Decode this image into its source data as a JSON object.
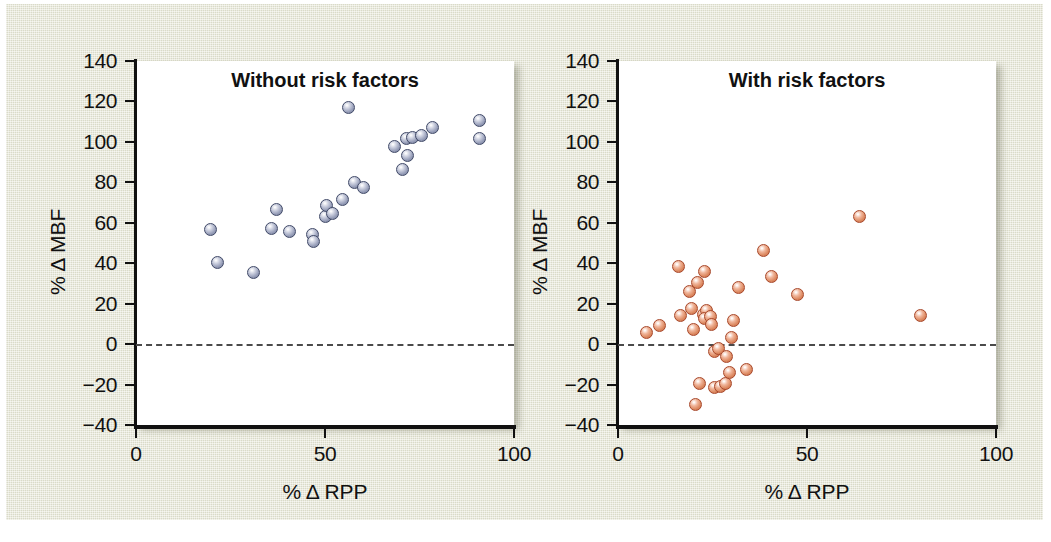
{
  "figure": {
    "background_color": "#e3e4d1",
    "panel_background": "#ffffff"
  },
  "axis": {
    "y_label": "% Δ MBF",
    "x_label": "% Δ RPP",
    "y_ticks": [
      140,
      120,
      100,
      80,
      60,
      40,
      20,
      0,
      -20,
      -40
    ],
    "y_tick_labels": [
      "140",
      "120",
      "100",
      "80",
      "60",
      "40",
      "20",
      "0",
      "−20",
      "−40"
    ],
    "x_ticks": [
      0,
      50,
      100
    ],
    "x_tick_labels": [
      "0",
      "50",
      "100"
    ],
    "ylim": [
      -40,
      140
    ],
    "xlim": [
      0,
      100
    ],
    "zero_reference_line": 0
  },
  "chart_data": [
    {
      "type": "scatter",
      "title": "Without risk factors",
      "xlabel": "% Δ RPP",
      "ylabel": "% Δ MBF",
      "xlim": [
        0,
        100
      ],
      "ylim": [
        -40,
        140
      ],
      "grid": false,
      "legend": "none",
      "marker_color": "#8f97b4",
      "marker_edge_color": "#414a68",
      "annotations": [
        "dashed horizontal reference line at % Δ MBF = 0"
      ],
      "points": [
        {
          "x": 19.8,
          "y": 56.5
        },
        {
          "x": 21.5,
          "y": 40.3
        },
        {
          "x": 31.0,
          "y": 35.5
        },
        {
          "x": 35.8,
          "y": 57.3
        },
        {
          "x": 37.2,
          "y": 66.5
        },
        {
          "x": 40.5,
          "y": 55.8
        },
        {
          "x": 46.8,
          "y": 54.0
        },
        {
          "x": 46.9,
          "y": 50.5
        },
        {
          "x": 50.2,
          "y": 63.0
        },
        {
          "x": 50.5,
          "y": 68.5
        },
        {
          "x": 54.5,
          "y": 71.5
        },
        {
          "x": 52.0,
          "y": 64.8
        },
        {
          "x": 56.3,
          "y": 116.8
        },
        {
          "x": 57.8,
          "y": 80.0
        },
        {
          "x": 60.2,
          "y": 77.5
        },
        {
          "x": 68.5,
          "y": 97.5
        },
        {
          "x": 70.5,
          "y": 86.3
        },
        {
          "x": 71.8,
          "y": 93.5
        },
        {
          "x": 71.5,
          "y": 101.5
        },
        {
          "x": 73.2,
          "y": 102.0
        },
        {
          "x": 75.5,
          "y": 103.0
        },
        {
          "x": 78.5,
          "y": 107.0
        },
        {
          "x": 90.8,
          "y": 110.5
        },
        {
          "x": 91.0,
          "y": 101.5
        }
      ]
    },
    {
      "type": "scatter",
      "title": "With risk factors",
      "xlabel": "% Δ RPP",
      "ylabel": "% Δ MBF",
      "xlim": [
        0,
        100
      ],
      "ylim": [
        -40,
        140
      ],
      "grid": false,
      "legend": "none",
      "marker_color": "#dd8b63",
      "marker_edge_color": "#a8482b",
      "annotations": [
        "dashed horizontal reference line at % Δ MBF = 0"
      ],
      "points": [
        {
          "x": 7.5,
          "y": 5.5
        },
        {
          "x": 11.0,
          "y": 9.0
        },
        {
          "x": 16.0,
          "y": 38.2
        },
        {
          "x": 16.5,
          "y": 14.0
        },
        {
          "x": 19.0,
          "y": 26.0
        },
        {
          "x": 19.5,
          "y": 17.5
        },
        {
          "x": 20.0,
          "y": 7.0
        },
        {
          "x": 21.0,
          "y": 30.5
        },
        {
          "x": 21.5,
          "y": -19.5
        },
        {
          "x": 20.5,
          "y": -30.0
        },
        {
          "x": 22.8,
          "y": 36.0
        },
        {
          "x": 22.5,
          "y": 14.5
        },
        {
          "x": 23.5,
          "y": 16.5
        },
        {
          "x": 23.0,
          "y": 12.5
        },
        {
          "x": 24.5,
          "y": 13.5
        },
        {
          "x": 24.8,
          "y": 9.5
        },
        {
          "x": 25.5,
          "y": -3.5
        },
        {
          "x": 26.5,
          "y": -2.0
        },
        {
          "x": 25.5,
          "y": -21.5
        },
        {
          "x": 27.0,
          "y": -21.0
        },
        {
          "x": 28.5,
          "y": -19.5
        },
        {
          "x": 29.5,
          "y": -14.0
        },
        {
          "x": 28.8,
          "y": -6.0
        },
        {
          "x": 30.5,
          "y": 11.5
        },
        {
          "x": 30.0,
          "y": 3.5
        },
        {
          "x": 32.0,
          "y": 28.0
        },
        {
          "x": 34.0,
          "y": -12.5
        },
        {
          "x": 38.5,
          "y": 46.5
        },
        {
          "x": 40.5,
          "y": 33.5
        },
        {
          "x": 47.5,
          "y": 24.5
        },
        {
          "x": 64.0,
          "y": 63.0
        },
        {
          "x": 80.0,
          "y": 14.0
        }
      ]
    }
  ]
}
